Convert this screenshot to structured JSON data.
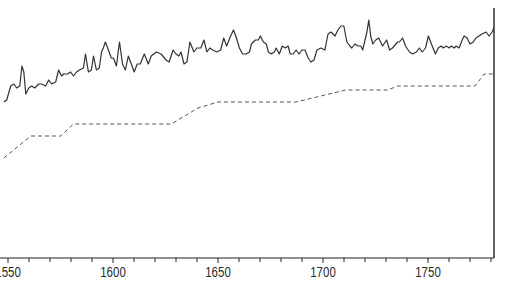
{
  "chart_data": {
    "type": "line",
    "title": "",
    "xlabel": "",
    "ylabel": "",
    "xlim": [
      1548,
      1782
    ],
    "ylim": [
      0,
      100
    ],
    "grid": false,
    "legend": "none",
    "x_ticks": [
      1550,
      1600,
      1650,
      1700,
      1750
    ],
    "x_tick_labels": [
      "1550",
      "1600",
      "1650",
      "1700",
      "1750"
    ],
    "x_minor_step": 10,
    "series": [
      {
        "name": "annual series",
        "style": "solid",
        "color": "#333333",
        "points": [
          [
            1548,
            54
          ],
          [
            1549.4,
            55
          ],
          [
            1551.3,
            62
          ],
          [
            1552.8,
            63
          ],
          [
            1554.2,
            61
          ],
          [
            1555.6,
            62
          ],
          [
            1556.6,
            72
          ],
          [
            1557.5,
            69
          ],
          [
            1558.5,
            58
          ],
          [
            1559.9,
            61
          ],
          [
            1561.3,
            62
          ],
          [
            1562.7,
            61
          ],
          [
            1564.6,
            63
          ],
          [
            1566,
            63
          ],
          [
            1567.9,
            62
          ],
          [
            1569.4,
            65
          ],
          [
            1570.8,
            63
          ],
          [
            1572.7,
            64
          ],
          [
            1574.1,
            70
          ],
          [
            1575.5,
            67
          ],
          [
            1576.5,
            68
          ],
          [
            1578.4,
            68
          ],
          [
            1579.8,
            69
          ],
          [
            1581.2,
            67
          ],
          [
            1582.6,
            69
          ],
          [
            1584,
            70
          ],
          [
            1585.9,
            71
          ],
          [
            1586.9,
            78
          ],
          [
            1588.3,
            69
          ],
          [
            1589.7,
            70
          ],
          [
            1590.7,
            77
          ],
          [
            1592.1,
            70
          ],
          [
            1593.5,
            71
          ],
          [
            1594.5,
            79
          ],
          [
            1595.4,
            81
          ],
          [
            1596.4,
            84
          ],
          [
            1597.8,
            80
          ],
          [
            1599.2,
            76
          ],
          [
            1600.2,
            76
          ],
          [
            1601.6,
            72
          ],
          [
            1603.1,
            84
          ],
          [
            1604.5,
            73
          ],
          [
            1605.9,
            70
          ],
          [
            1607.3,
            77
          ],
          [
            1608.7,
            73
          ],
          [
            1610.1,
            69
          ],
          [
            1611.5,
            73
          ],
          [
            1613,
            73
          ],
          [
            1614.9,
            78
          ],
          [
            1616.8,
            73
          ],
          [
            1618.2,
            77
          ],
          [
            1620.6,
            79
          ],
          [
            1622.9,
            78
          ],
          [
            1625.3,
            75
          ],
          [
            1626.7,
            74
          ],
          [
            1628.6,
            80
          ],
          [
            1630,
            78
          ],
          [
            1631.4,
            77
          ],
          [
            1632.4,
            79
          ],
          [
            1633.8,
            73
          ],
          [
            1635.2,
            74
          ],
          [
            1636.6,
            84
          ],
          [
            1638.5,
            79
          ],
          [
            1639.9,
            81
          ],
          [
            1641.8,
            81
          ],
          [
            1643.3,
            85
          ],
          [
            1644.7,
            79
          ],
          [
            1646.1,
            81
          ],
          [
            1647.5,
            80
          ],
          [
            1649.4,
            79
          ],
          [
            1651.3,
            80
          ],
          [
            1652.7,
            86
          ],
          [
            1654.1,
            82
          ],
          [
            1656,
            87
          ],
          [
            1657.4,
            90
          ],
          [
            1658.8,
            86
          ],
          [
            1660.2,
            81
          ],
          [
            1661.7,
            78
          ],
          [
            1663.5,
            78
          ],
          [
            1665,
            79
          ],
          [
            1665.9,
            83
          ],
          [
            1667.8,
            85
          ],
          [
            1669.2,
            85
          ],
          [
            1670.2,
            87
          ],
          [
            1671.6,
            84
          ],
          [
            1673,
            83
          ],
          [
            1674,
            79
          ],
          [
            1675.4,
            78
          ],
          [
            1676.8,
            79
          ],
          [
            1677.7,
            81
          ],
          [
            1679.2,
            78
          ],
          [
            1680.6,
            82
          ],
          [
            1682,
            81
          ],
          [
            1683.4,
            82
          ],
          [
            1684.4,
            78
          ],
          [
            1685.8,
            78
          ],
          [
            1687.2,
            80
          ],
          [
            1688.6,
            78
          ],
          [
            1690,
            80
          ],
          [
            1691.5,
            80
          ],
          [
            1692.9,
            76
          ],
          [
            1694.3,
            74
          ],
          [
            1695.7,
            75
          ],
          [
            1697.1,
            80
          ],
          [
            1699,
            81
          ],
          [
            1700.9,
            80
          ],
          [
            1702.4,
            88
          ],
          [
            1703.8,
            89
          ],
          [
            1705.7,
            87
          ],
          [
            1707.1,
            90
          ],
          [
            1708.5,
            92
          ],
          [
            1709.9,
            92
          ],
          [
            1711.4,
            84
          ],
          [
            1712.8,
            82
          ],
          [
            1713.7,
            81
          ],
          [
            1715.2,
            83
          ],
          [
            1716.6,
            82
          ],
          [
            1718,
            82
          ],
          [
            1718.9,
            80
          ],
          [
            1720.9,
            89
          ],
          [
            1721.8,
            95
          ],
          [
            1722.7,
            87
          ],
          [
            1723.7,
            83
          ],
          [
            1725.1,
            85
          ],
          [
            1726.5,
            86
          ],
          [
            1728.4,
            82
          ],
          [
            1730.3,
            85
          ],
          [
            1731.7,
            80
          ],
          [
            1733.1,
            81
          ],
          [
            1735.5,
            84
          ],
          [
            1736.4,
            84
          ],
          [
            1737.9,
            86
          ],
          [
            1739.3,
            82
          ],
          [
            1741.2,
            79
          ],
          [
            1742.6,
            78
          ],
          [
            1744.5,
            79
          ],
          [
            1745.9,
            81
          ],
          [
            1747.3,
            79
          ],
          [
            1748.8,
            81
          ],
          [
            1750.2,
            87
          ],
          [
            1751.6,
            83
          ],
          [
            1753.5,
            78
          ],
          [
            1754.9,
            81
          ],
          [
            1756.3,
            82
          ],
          [
            1757.3,
            81
          ],
          [
            1758.7,
            82
          ],
          [
            1760.1,
            81
          ],
          [
            1761.1,
            82
          ],
          [
            1762.5,
            81
          ],
          [
            1763.4,
            82
          ],
          [
            1764.8,
            81
          ],
          [
            1766.3,
            85
          ],
          [
            1767.2,
            87
          ],
          [
            1768.6,
            86
          ],
          [
            1770,
            83
          ],
          [
            1771.5,
            84
          ],
          [
            1772.9,
            86
          ],
          [
            1774.3,
            87
          ],
          [
            1775.7,
            88
          ],
          [
            1777.6,
            89
          ],
          [
            1779.1,
            87
          ],
          [
            1780.5,
            89
          ],
          [
            1781.4,
            91
          ],
          [
            1782.8,
            92
          ],
          [
            1784.3,
            90
          ],
          [
            1785.2,
            88
          ],
          [
            1785.7,
            91
          ],
          [
            1786.2,
            89
          ],
          [
            1786.6,
            88
          ],
          [
            1787.1,
            86
          ],
          [
            1787.6,
            90
          ],
          [
            1788.5,
            89
          ],
          [
            1789.5,
            88
          ],
          [
            1791.4,
            89
          ]
        ]
      },
      {
        "name": "trend steps",
        "style": "dashed",
        "color": "#555555",
        "points": [
          [
            1548,
            26
          ],
          [
            1560.9,
            37
          ],
          [
            1575.1,
            37
          ],
          [
            1581.2,
            43
          ],
          [
            1627.7,
            43
          ],
          [
            1640.5,
            51
          ],
          [
            1650,
            54
          ],
          [
            1687.1,
            54
          ],
          [
            1710.8,
            60
          ],
          [
            1730.8,
            60
          ],
          [
            1735.5,
            62
          ],
          [
            1772.4,
            62
          ],
          [
            1776.7,
            68
          ],
          [
            1783.3,
            68
          ]
        ]
      }
    ]
  }
}
